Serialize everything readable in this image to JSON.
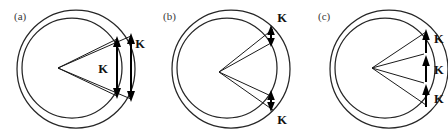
{
  "figure": {
    "width": 448,
    "height": 135,
    "background": "#ffffff",
    "stroke_color": "#262626",
    "label_color": "#3a3a3a",
    "arrow_color": "#000000",
    "vector_symbol": "K"
  },
  "panels": [
    {
      "id": "a",
      "label": "(a)",
      "label_x": 14,
      "label_y": 20,
      "outer": {
        "cx": 76,
        "cy": 69,
        "r": 59
      },
      "inner": {
        "cx": 72,
        "cy": 68,
        "r": 50
      },
      "vertex": {
        "x": 58,
        "y": 68
      },
      "rays": [
        {
          "x": 117,
          "y": 39
        },
        {
          "x": 117,
          "y": 96
        },
        {
          "x": 131,
          "y": 36
        },
        {
          "x": 131,
          "y": 99
        }
      ],
      "k_arrows": [
        {
          "id": "a-k-inner",
          "x": 117,
          "y1": 39,
          "y2": 96,
          "label": "K",
          "label_x": 103,
          "label_y": 73
        },
        {
          "id": "a-k-outer",
          "x": 131,
          "y1": 36,
          "y2": 99,
          "label": "K",
          "label_x": 136,
          "label_y": 48
        }
      ]
    },
    {
      "id": "b",
      "label": "(b)",
      "label_x": 163,
      "label_y": 20,
      "outer": {
        "cx": 231,
        "cy": 69,
        "r": 59
      },
      "inner": {
        "cx": 227,
        "cy": 68,
        "r": 50
      },
      "vertex": {
        "x": 219,
        "y": 72
      },
      "rays": [
        {
          "x": 269,
          "y": 38
        },
        {
          "x": 273,
          "y": 28
        },
        {
          "x": 269,
          "y": 101
        },
        {
          "x": 273,
          "y": 111
        }
      ],
      "k_arrows": [
        {
          "id": "b-k-top",
          "x": 271,
          "y1": 28,
          "y2": 44,
          "label": "K",
          "label_x": 279,
          "label_y": 19
        },
        {
          "id": "b-k-bottom",
          "x": 271,
          "y1": 95,
          "y2": 111,
          "label": "K",
          "label_x": 279,
          "label_y": 124
        }
      ]
    },
    {
      "id": "c",
      "label": "(c)",
      "label_x": 318,
      "label_y": 20,
      "outer": {
        "cx": 389,
        "cy": 69,
        "r": 59
      },
      "inner": {
        "cx": 385,
        "cy": 68,
        "r": 50
      },
      "vertex": {
        "x": 372,
        "y": 68
      },
      "rays": [
        {
          "x": 426,
          "y": 32
        },
        {
          "x": 424,
          "y": 53
        },
        {
          "x": 424,
          "y": 84
        },
        {
          "x": 426,
          "y": 105
        }
      ],
      "k_arrows": [
        {
          "id": "c-k-top",
          "x": 426,
          "y1": 32,
          "y2": 54,
          "label": "K",
          "label_x": 432,
          "label_y": 42
        },
        {
          "id": "c-k-mid",
          "x": 426,
          "y1": 55,
          "y2": 83,
          "label": "K",
          "label_x": 432,
          "label_y": 73
        },
        {
          "id": "c-k-bottom",
          "x": 426,
          "y1": 84,
          "y2": 106,
          "label": "K",
          "label_x": 432,
          "label_y": 102
        }
      ]
    }
  ]
}
